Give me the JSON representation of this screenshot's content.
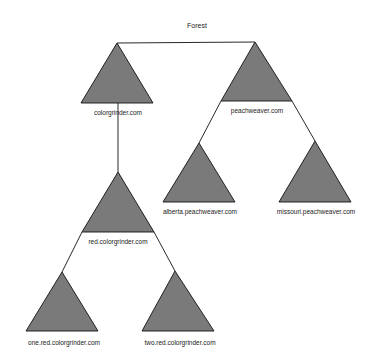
{
  "diagram": {
    "title": "Forest",
    "colors": {
      "triangle_fill": "#7a7a7a",
      "stroke": "#111111",
      "background": "#ffffff"
    },
    "nodes": [
      {
        "id": "colorgrinder",
        "label": "colorgrinder.com",
        "parent": "forest"
      },
      {
        "id": "peachweaver",
        "label": "peachweaver.com",
        "parent": "forest"
      },
      {
        "id": "red",
        "label": "red.colorgrinder.com",
        "parent": "colorgrinder"
      },
      {
        "id": "alberta",
        "label": "alberta.peachweaver.com",
        "parent": "peachweaver"
      },
      {
        "id": "missouri",
        "label": "missouri.peachweaver.com",
        "parent": "peachweaver"
      },
      {
        "id": "one",
        "label": "one.red.colorgrinder.com",
        "parent": "red"
      },
      {
        "id": "two",
        "label": "two.red.colorgrinder.com",
        "parent": "red"
      }
    ]
  }
}
